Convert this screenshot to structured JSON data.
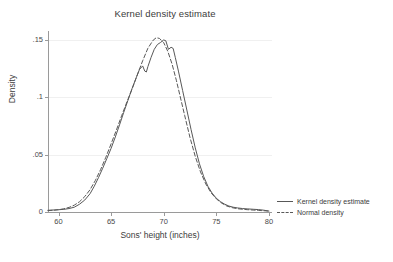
{
  "chart_data": {
    "type": "line",
    "title": "Kernel density estimate",
    "xlabel": "Sons' height (inches)",
    "ylabel": "Density",
    "xlim": [
      59,
      80.2
    ],
    "ylim": [
      0,
      0.158
    ],
    "grid": true,
    "legend_position": "right",
    "xticks": [
      60,
      65,
      70,
      75,
      80
    ],
    "xtick_labels": [
      "60",
      "65",
      "70",
      "75",
      "80"
    ],
    "yticks": [
      0,
      0.05,
      0.1,
      0.15
    ],
    "ytick_labels": [
      "0",
      ".05",
      ".1",
      ".15"
    ],
    "series": [
      {
        "name": "Kernel density estimate",
        "style": "solid",
        "color": "#585858",
        "x": [
          59.0,
          59.6,
          60.0,
          60.5,
          61.0,
          61.5,
          62.0,
          62.5,
          63.0,
          63.4,
          63.8,
          64.2,
          64.6,
          65.0,
          65.4,
          65.8,
          66.2,
          66.6,
          67.0,
          67.4,
          67.7,
          68.0,
          68.2,
          68.35,
          68.5,
          68.8,
          69.1,
          69.4,
          69.7,
          70.0,
          70.2,
          70.45,
          70.7,
          70.9,
          71.1,
          71.4,
          71.8,
          72.2,
          72.6,
          73.0,
          73.4,
          73.8,
          74.2,
          74.6,
          75.0,
          75.4,
          75.8,
          76.2,
          76.6,
          77.0,
          77.5,
          78.0,
          78.5,
          79.0,
          79.5,
          80.0
        ],
        "y": [
          0.0015,
          0.0018,
          0.002,
          0.0023,
          0.003,
          0.0042,
          0.0068,
          0.0105,
          0.016,
          0.0225,
          0.03,
          0.0382,
          0.0468,
          0.0556,
          0.0655,
          0.076,
          0.087,
          0.0975,
          0.108,
          0.1175,
          0.1245,
          0.1275,
          0.123,
          0.1222,
          0.127,
          0.135,
          0.142,
          0.1462,
          0.148,
          0.1502,
          0.1495,
          0.142,
          0.1438,
          0.1428,
          0.135,
          0.123,
          0.106,
          0.089,
          0.072,
          0.056,
          0.042,
          0.031,
          0.0225,
          0.0165,
          0.012,
          0.009,
          0.0068,
          0.0052,
          0.0042,
          0.0036,
          0.003,
          0.0027,
          0.0024,
          0.0021,
          0.0016,
          0.0008
        ]
      },
      {
        "name": "Normal density",
        "style": "dashed",
        "color": "#585858",
        "x": [
          59.0,
          59.6,
          60.0,
          60.5,
          61.0,
          61.5,
          62.0,
          62.5,
          63.0,
          63.5,
          64.0,
          64.5,
          65.0,
          65.5,
          66.0,
          66.5,
          67.0,
          67.5,
          68.0,
          68.5,
          69.0,
          69.3,
          69.6,
          70.0,
          70.4,
          70.8,
          71.2,
          71.6,
          72.0,
          72.5,
          73.0,
          73.5,
          74.0,
          74.5,
          75.0,
          75.5,
          76.0,
          76.5,
          77.0,
          77.5,
          78.0,
          78.5,
          79.0,
          79.5,
          80.0
        ],
        "y": [
          0.0012,
          0.0016,
          0.002,
          0.0028,
          0.004,
          0.006,
          0.009,
          0.0135,
          0.0195,
          0.0275,
          0.037,
          0.0478,
          0.0595,
          0.0715,
          0.084,
          0.096,
          0.1075,
          0.12,
          0.132,
          0.143,
          0.15,
          0.1522,
          0.1515,
          0.1478,
          0.14,
          0.129,
          0.115,
          0.0995,
          0.084,
          0.065,
          0.0485,
          0.035,
          0.0245,
          0.0168,
          0.0115,
          0.0078,
          0.0052,
          0.0038,
          0.0029,
          0.0024,
          0.002,
          0.0017,
          0.0014,
          0.0011,
          0.0008
        ]
      }
    ]
  },
  "legend": {
    "items": [
      {
        "label": "Kernel density estimate",
        "style": "solid"
      },
      {
        "label": "Normal density",
        "style": "dashed"
      }
    ]
  }
}
